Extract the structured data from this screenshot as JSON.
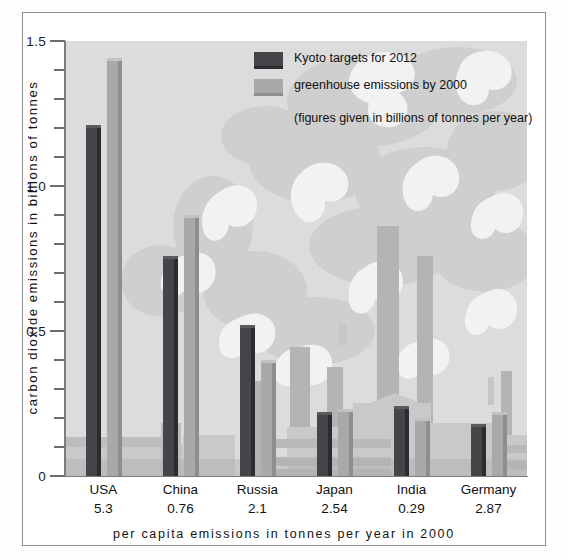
{
  "chart_data": {
    "type": "bar",
    "title": "",
    "xlabel": "per capita emissions in tonnes per year in 2000",
    "ylabel": "carbon dioxide emissions in billions of tonnes",
    "ylim": [
      0,
      1.5
    ],
    "ytick_step": 0.1,
    "grid": false,
    "legend_position": "inside-top-center",
    "note": "(figures given in billions of tonnes per year)",
    "categories": [
      "USA",
      "China",
      "Russia",
      "Japan",
      "India",
      "Germany"
    ],
    "per_capita_values": [
      "5.3",
      "0.76",
      "2.1",
      "2.54",
      "0.29",
      "2.87"
    ],
    "ytick_labels": [
      "0",
      "0.5",
      "1.0",
      "1.5"
    ],
    "ytick_values": [
      0,
      0.5,
      1.0,
      1.5
    ],
    "series": [
      {
        "name": "Kyoto targets for 2012",
        "color": "#444549",
        "values": [
          1.21,
          0.76,
          0.52,
          0.22,
          0.24,
          0.18
        ]
      },
      {
        "name": "greenhouse emissions by 2000",
        "color": "#a9a9a9",
        "values": [
          1.44,
          0.9,
          0.4,
          0.23,
          0.2,
          0.22
        ]
      }
    ]
  },
  "axes": {
    "y_title": "carbon dioxide emissions in billions of tonnes",
    "x_title": "per capita emissions in tonnes per year in 2000"
  },
  "legend": {
    "items": [
      {
        "label": "Kyoto targets for 2012",
        "swatch": "dark"
      },
      {
        "label": "greenhouse emissions by 2000",
        "swatch": "light"
      }
    ],
    "note": "(figures given in billions of tonnes per year)"
  }
}
